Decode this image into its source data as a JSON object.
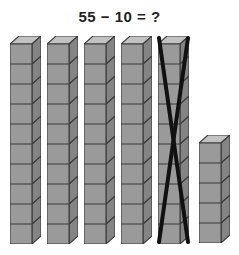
{
  "problem": {
    "equation": "55 − 10 = ?",
    "minuend": 55,
    "subtrahend": 10,
    "answer_placeholder": "?"
  },
  "colors": {
    "background": "#ffffff",
    "text": "#231f20",
    "cube_front": "#9a9a9a",
    "cube_top": "#c2c2c2",
    "cube_side": "#848484",
    "cube_outline": "#3b3b3b",
    "crossout": "#111111"
  },
  "model": {
    "type": "base-ten-blocks",
    "unit_label": "cube",
    "rod_label": "rod-of-ten",
    "rods": [
      {
        "name": "rod-1",
        "cubes": 10,
        "crossed_out": false,
        "x": 10,
        "top": 36
      },
      {
        "name": "rod-2",
        "cubes": 10,
        "crossed_out": false,
        "x": 47,
        "top": 36
      },
      {
        "name": "rod-3",
        "cubes": 10,
        "crossed_out": false,
        "x": 84,
        "top": 36
      },
      {
        "name": "rod-4",
        "cubes": 10,
        "crossed_out": false,
        "x": 121,
        "top": 36
      },
      {
        "name": "rod-5",
        "cubes": 10,
        "crossed_out": true,
        "x": 158,
        "top": 36
      },
      {
        "name": "rod-6",
        "cubes": 5,
        "crossed_out": false,
        "x": 199,
        "top": 135
      }
    ],
    "total_shown": 55,
    "crossed_out_count": 10,
    "remaining": 45
  }
}
